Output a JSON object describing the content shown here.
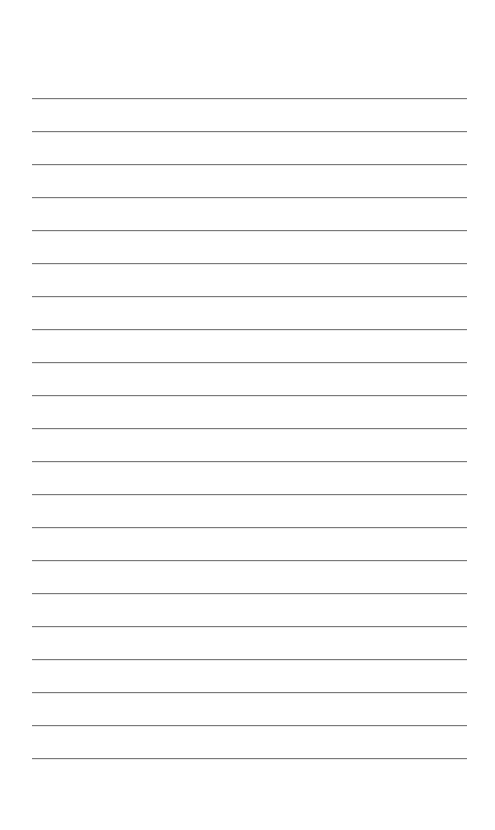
{
  "page": {
    "type": "lined-paper",
    "background_color": "#ffffff",
    "line_color": "#7a7a7a",
    "line_count": 21,
    "first_line_y": 98,
    "line_spacing": 33,
    "line_left": 32,
    "line_right": 467
  }
}
